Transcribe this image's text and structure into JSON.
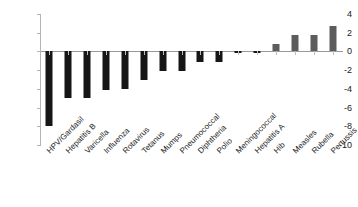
{
  "chart_data": {
    "type": "bar",
    "title": "",
    "subtitle": "",
    "xlabel": "",
    "ylabel": "",
    "ylim": [
      -10,
      4
    ],
    "ytick_labels": [
      "4",
      "2",
      "0",
      "-2",
      "-4",
      "-6",
      "-8",
      "-10"
    ],
    "yticks": [
      4,
      2,
      0,
      -2,
      -4,
      -6,
      -8,
      -10
    ],
    "grid": false,
    "legend": null,
    "categories": [
      "HPV/Gardasil",
      "Hepatitis B",
      "Varicella",
      "Influenza",
      "Rotavirus",
      "Tetanus",
      "Mumps",
      "Pneumococcal",
      "Diphtheria",
      "Polio",
      "Meningococcal",
      "Hepatitis A",
      "Hib",
      "Measles",
      "Rubella",
      "Pertussis"
    ],
    "values": [
      -8.0,
      -5.0,
      -5.0,
      -4.1,
      -4.0,
      -3.1,
      -2.1,
      -2.1,
      -1.1,
      -1.1,
      -0.12,
      -0.15,
      0.8,
      1.8,
      1.8,
      2.7
    ],
    "colors": {
      "negative_bar": "#161616",
      "positive_bar": "#5c5c5c",
      "axis": "#b5b5b5",
      "baseline": "#9a9a9a",
      "text": "#1a1a1a",
      "background": "#ffffff"
    }
  }
}
